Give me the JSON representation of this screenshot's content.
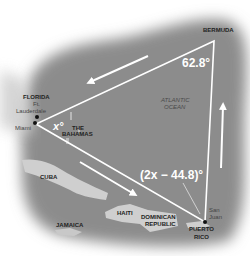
{
  "figure": {
    "type": "map-diagram"
  },
  "colors": {
    "ocean": "#8c8c8c",
    "land": "#d2d2d2",
    "triangle": "#ffffff",
    "label": "#222222"
  },
  "vertices": {
    "bermuda": {
      "label": "BERMUDA"
    },
    "florida": {
      "label": "FLORIDA"
    },
    "puerto_rico": {
      "label_line1": "PUERTO",
      "label_line2": "RICO"
    }
  },
  "angles": {
    "bermuda": "62.8°",
    "miami": "x°",
    "puerto_rico": "(2x − 44.8)°"
  },
  "places": {
    "ft_lauderdale_line1": "Ft.",
    "ft_lauderdale_line2": "Lauderdale",
    "miami": "Miami",
    "bahamas_line1": "THE",
    "bahamas_line2": "BAHAMAS",
    "atlantic_line1": "ATLANTIC",
    "atlantic_line2": "OCEAN",
    "cuba": "CUBA",
    "haiti": "HAITI",
    "dominican_line1": "DOMINICAN",
    "dominican_line2": "REPUBLIC",
    "jamaica": "JAMAICA",
    "san_juan_line1": "San",
    "san_juan_line2": "Juan"
  }
}
